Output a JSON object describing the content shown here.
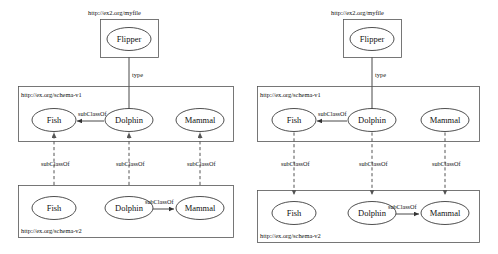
{
  "diagram": {
    "type": "graph",
    "panel_count": 2,
    "colors": {
      "background": "#ffffff",
      "box_stroke": "#555555",
      "node_stroke": "#222222",
      "edge_solid": "#333333",
      "edge_dashed": "#555555",
      "text": "#111111"
    },
    "labels": {
      "instance_graph_uri": "http://ex2.org/myfile",
      "schema_v1_uri": "http://ex.org/schema-v1",
      "schema_v2_uri": "http://ex.org/schema-v2",
      "type_edge": "type",
      "subclass_edge": "subClassOf"
    },
    "nodes": {
      "flipper": "Flipper",
      "fish": "Fish",
      "dolphin": "Dolphin",
      "mammal": "Mammal"
    },
    "panels": [
      {
        "id": "left-panel",
        "name": "left-diagram",
        "instance_box": {
          "uri": "http://ex2.org/myfile",
          "nodes": [
            "Flipper"
          ]
        },
        "schema_v1_box": {
          "uri": "http://ex.org/schema-v1",
          "nodes": [
            "Fish",
            "Dolphin",
            "Mammal"
          ]
        },
        "schema_v2_box": {
          "uri": "http://ex.org/schema-v2",
          "nodes": [
            "Fish",
            "Dolphin",
            "Mammal"
          ]
        },
        "edges": [
          {
            "from": "Flipper",
            "to": "Dolphin",
            "label": "type",
            "style": "solid",
            "direction": "down"
          },
          {
            "from": "Dolphin",
            "to": "Fish",
            "label": "subClassOf",
            "style": "solid",
            "direction": "left",
            "scope": "schema-v1"
          },
          {
            "from": "Dolphin",
            "to": "Mammal",
            "label": "subClassOf",
            "style": "solid",
            "direction": "right",
            "scope": "schema-v2"
          },
          {
            "from": "Fish (v2)",
            "to": "Fish (v1)",
            "label": "subClassOf",
            "style": "dashed",
            "direction": "up"
          },
          {
            "from": "Dolphin (v2)",
            "to": "Dolphin (v1)",
            "label": "subClassOf",
            "style": "dashed",
            "direction": "up"
          },
          {
            "from": "Mammal (v2)",
            "to": "Mammal (v1)",
            "label": "subClassOf",
            "style": "dashed",
            "direction": "up"
          }
        ]
      },
      {
        "id": "right-panel",
        "name": "right-diagram",
        "instance_box": {
          "uri": "http://ex2.org/myfile",
          "nodes": [
            "Flipper"
          ]
        },
        "schema_v1_box": {
          "uri": "http://ex.org/schema-v1",
          "nodes": [
            "Fish",
            "Dolphin",
            "Mammal"
          ]
        },
        "schema_v2_box": {
          "uri": "http://ex.org/schema-v2",
          "nodes": [
            "Fish",
            "Dolphin",
            "Mammal"
          ]
        },
        "edges": [
          {
            "from": "Flipper",
            "to": "Dolphin",
            "label": "type",
            "style": "solid",
            "direction": "down"
          },
          {
            "from": "Dolphin",
            "to": "Fish",
            "label": "subClassOf",
            "style": "solid",
            "direction": "left",
            "scope": "schema-v1"
          },
          {
            "from": "Dolphin",
            "to": "Mammal",
            "label": "subClassOf",
            "style": "solid",
            "direction": "right",
            "scope": "schema-v2"
          },
          {
            "from": "Fish (v1)",
            "to": "Fish (v2)",
            "label": "subClassOf",
            "style": "dashed",
            "direction": "down"
          },
          {
            "from": "Dolphin (v1)",
            "to": "Dolphin (v2)",
            "label": "subClassOf",
            "style": "dashed",
            "direction": "down"
          },
          {
            "from": "Mammal (v1)",
            "to": "Mammal (v2)",
            "label": "subClassOf",
            "style": "dashed",
            "direction": "down"
          }
        ]
      }
    ]
  }
}
